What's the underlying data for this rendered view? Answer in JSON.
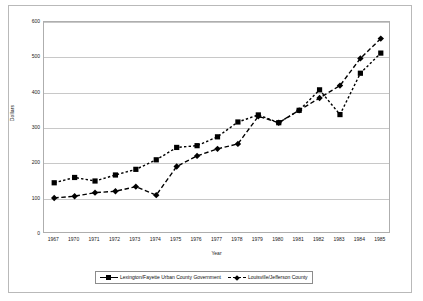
{
  "chart_data": {
    "type": "line",
    "title": "",
    "xlabel": "Year",
    "ylabel": "Dollars",
    "ylim": [
      0,
      600
    ],
    "yticks": [
      0,
      100,
      200,
      300,
      400,
      500,
      600
    ],
    "grid": true,
    "legend_position": "bottom",
    "categories": [
      "1967",
      "1970",
      "1971",
      "1972",
      "1973",
      "1974",
      "1975",
      "1976",
      "1977",
      "1978",
      "1979",
      "1980",
      "1981",
      "1982",
      "1983",
      "1984",
      "1985"
    ],
    "series": [
      {
        "name": "Lexington/Fayette Urban County Government",
        "marker": "square",
        "line_style": "dotted",
        "color": "#000000",
        "values": [
          145,
          160,
          150,
          167,
          183,
          210,
          245,
          250,
          275,
          317,
          337,
          315,
          350,
          408,
          338,
          455,
          512
        ]
      },
      {
        "name": "Louisville/Jefferson County",
        "marker": "diamond",
        "line_style": "dashed",
        "color": "#000000",
        "values": [
          102,
          107,
          117,
          121,
          134,
          110,
          191,
          221,
          241,
          255,
          333,
          315,
          350,
          385,
          420,
          497,
          553
        ]
      }
    ]
  },
  "axis": {
    "y_title": "Dollars",
    "x_title": "Year"
  },
  "legend": {
    "entries": [
      {
        "label": "Lexington/Fayette Urban County Government",
        "marker": "square-icon",
        "style": "solid"
      },
      {
        "label": "Louisville/Jefferson County",
        "marker": "diamond-icon",
        "style": "dashed"
      }
    ]
  }
}
